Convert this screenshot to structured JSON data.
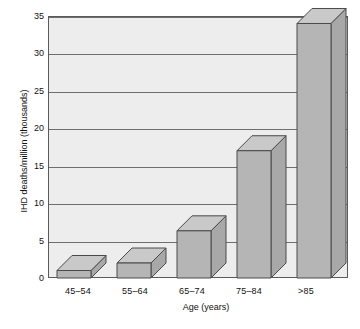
{
  "chart_data": {
    "type": "bar",
    "title": "",
    "subtitle": "",
    "xlabel": "Age (years)",
    "ylabel": "IHD deaths/million (thousands)",
    "categories": [
      "45–54",
      "55–64",
      "65–74",
      "75–84",
      ">85"
    ],
    "values": [
      1,
      2,
      6.3,
      17,
      34
    ],
    "ylim": [
      0,
      35
    ],
    "yticks": [
      0,
      5,
      10,
      15,
      20,
      25,
      30,
      35
    ],
    "ytick_labels": [
      "0",
      "5",
      "10",
      "15",
      "20",
      "25",
      "30",
      "35"
    ],
    "grid": true,
    "grid_axis": "y",
    "legend": null,
    "style": "3d-isometric",
    "annotations": []
  },
  "colors": {
    "bar_front": "#b5b5b5",
    "bar_top": "#c9c9c9",
    "bar_side": "#a8a8a8",
    "bar_edge": "#4a4a4a",
    "plot_background": "#ededed",
    "grid": "#6e6e6e",
    "axis": "#5a5a5a",
    "text": "#111111",
    "page_background": "#ffffff"
  },
  "axes": {
    "y": {
      "title": "IHD deaths/million (thousands)",
      "ticks": [
        {
          "value": 35,
          "label": "35"
        },
        {
          "value": 30,
          "label": "30"
        },
        {
          "value": 25,
          "label": "25"
        },
        {
          "value": 20,
          "label": "20"
        },
        {
          "value": 15,
          "label": "15"
        },
        {
          "value": 10,
          "label": "10"
        },
        {
          "value": 5,
          "label": "5"
        },
        {
          "value": 0,
          "label": "0"
        }
      ]
    },
    "x": {
      "title": "Age (years)",
      "ticks": [
        {
          "label": "45–54"
        },
        {
          "label": "55–64"
        },
        {
          "label": "65–74"
        },
        {
          "label": "75–84"
        },
        {
          "label": ">85"
        }
      ]
    }
  }
}
